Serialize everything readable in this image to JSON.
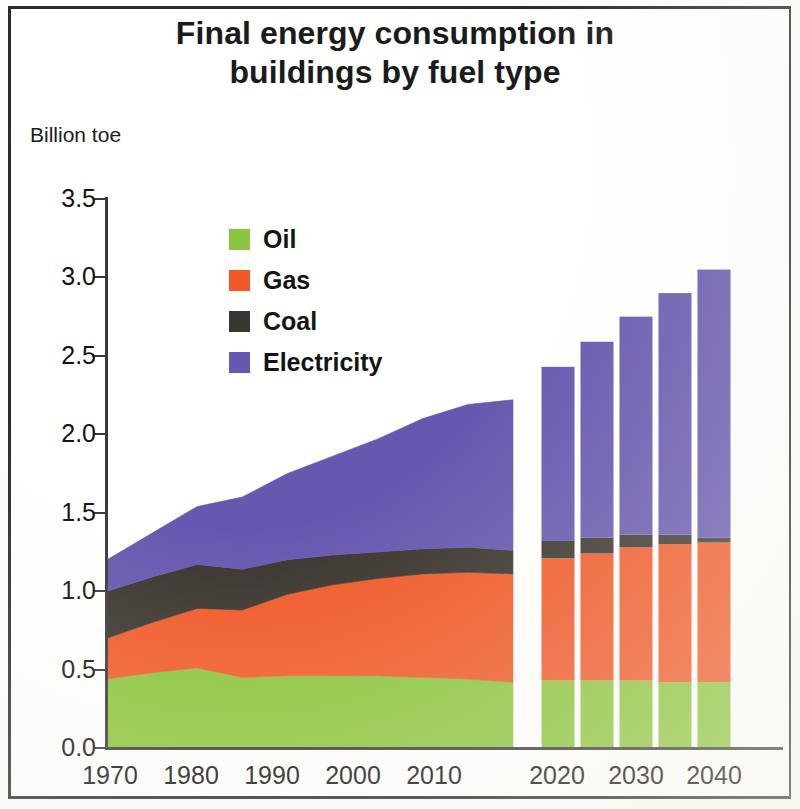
{
  "title": {
    "line1": "Final energy consumption in",
    "line2": "buildings by fuel type"
  },
  "axes": {
    "y_unit_label": "Billion toe",
    "y_ticks": [
      "0.0",
      "0.5",
      "1.0",
      "1.5",
      "2.0",
      "2.5",
      "3.0",
      "3.5"
    ],
    "x_ticks": [
      "1970",
      "1980",
      "1990",
      "2000",
      "2010",
      "2020",
      "2030",
      "2040"
    ]
  },
  "legend": {
    "position": "inside-top-left",
    "items": [
      {
        "label": "Oil",
        "color": "#8CC63E"
      },
      {
        "label": "Gas",
        "color": "#F05A2A"
      },
      {
        "label": "Coal",
        "color": "#3A352F"
      },
      {
        "label": "Electricity",
        "color": "#6857B0"
      }
    ]
  },
  "colors": {
    "oil": "#8CC63E",
    "gas": "#F05A2A",
    "coal": "#3A352F",
    "electricity": "#6857B0",
    "axis": "#3A3A3A",
    "text": "#121212",
    "frame": "#2B2B2B"
  },
  "chart_data": {
    "type": "area",
    "title": "Final energy consumption in buildings by fuel type",
    "subtitle": "",
    "xlabel": "",
    "ylabel": "Billion toe",
    "ylim": [
      0.0,
      3.5
    ],
    "xlim": [
      1970,
      2042
    ],
    "grid": false,
    "legend_position": "inside-top-left",
    "stacked": true,
    "note": "Historical 1970-2015 drawn as stacked area; 2020-2040 projections drawn as stacked bars",
    "series_order": [
      "Oil",
      "Gas",
      "Coal",
      "Electricity"
    ],
    "historical": {
      "type": "area",
      "x": [
        1970,
        1975,
        1980,
        1985,
        1990,
        1995,
        2000,
        2005,
        2010,
        2015
      ],
      "series": [
        {
          "name": "Oil",
          "color": "#8CC63E",
          "values": [
            0.44,
            0.48,
            0.51,
            0.45,
            0.46,
            0.46,
            0.46,
            0.45,
            0.44,
            0.42
          ]
        },
        {
          "name": "Gas",
          "color": "#F05A2A",
          "values": [
            0.26,
            0.32,
            0.38,
            0.43,
            0.52,
            0.58,
            0.62,
            0.66,
            0.68,
            0.69
          ]
        },
        {
          "name": "Coal",
          "color": "#3A352F",
          "values": [
            0.3,
            0.29,
            0.28,
            0.26,
            0.22,
            0.19,
            0.17,
            0.16,
            0.16,
            0.15
          ]
        },
        {
          "name": "Electricity",
          "color": "#6857B0",
          "values": [
            0.2,
            0.28,
            0.37,
            0.46,
            0.55,
            0.63,
            0.72,
            0.83,
            0.91,
            0.96
          ]
        }
      ],
      "totals": [
        1.2,
        1.37,
        1.54,
        1.6,
        1.75,
        1.86,
        1.97,
        2.1,
        2.19,
        2.22
      ]
    },
    "projection": {
      "type": "bar",
      "categories": [
        2020,
        2025,
        2030,
        2035,
        2040
      ],
      "series": [
        {
          "name": "Oil",
          "color": "#8CC63E",
          "values": [
            0.43,
            0.43,
            0.43,
            0.42,
            0.42
          ]
        },
        {
          "name": "Gas",
          "color": "#F05A2A",
          "values": [
            0.78,
            0.81,
            0.85,
            0.88,
            0.89
          ]
        },
        {
          "name": "Coal",
          "color": "#3A352F",
          "values": [
            0.11,
            0.1,
            0.08,
            0.06,
            0.03
          ]
        },
        {
          "name": "Electricity",
          "color": "#6857B0",
          "values": [
            1.11,
            1.25,
            1.39,
            1.54,
            1.71
          ]
        }
      ],
      "totals": [
        2.43,
        2.59,
        2.75,
        2.9,
        3.05
      ]
    }
  }
}
